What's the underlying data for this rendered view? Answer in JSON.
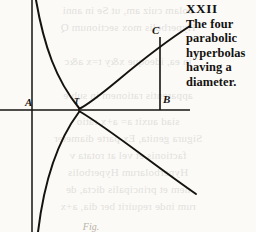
{
  "page": {
    "background_color": "#fbfaf7",
    "ink_color": "#16130f"
  },
  "caption": {
    "plate_number": "XXII",
    "line1": "The four",
    "line2": "parabolic",
    "line3": "hyperbolas",
    "line4": "having a",
    "line5": "diameter.",
    "full_text": "XXII The four parabolic hyperbolas having a diameter."
  },
  "figure": {
    "caption_below": "Fig.",
    "point_labels": {
      "A": "A",
      "T": "T",
      "B": "B",
      "C": "C"
    },
    "axes": {
      "vertical_axis_x": 32,
      "horizontal_axis_y": 110,
      "origin_label": "T"
    },
    "geometry_note": "four parabolic hyperbola branches meeting at T with ordinate CB erected at B"
  },
  "bleed_through": {
    "note": "faint mirrored show-through text from the reverse side of the leaf",
    "lines": [
      "bolam cuiz am, ut Se in anni",
      "Hyperbolis mox sectionum Q",
      "",
      "in ea, ideoque x&y t=x a&c",
      "",
      "apparentis rationem in sub e",
      "",
      "siad auxit a= a+x ratio",
      "Sigura genita, Ex parte diameter",
      "factionis et vel at rotata v",
      "Hyperbolarum Hyperbolis",
      "nem et principalis dicta, de",
      "rum inde requirit ber dia, a+x"
    ]
  }
}
